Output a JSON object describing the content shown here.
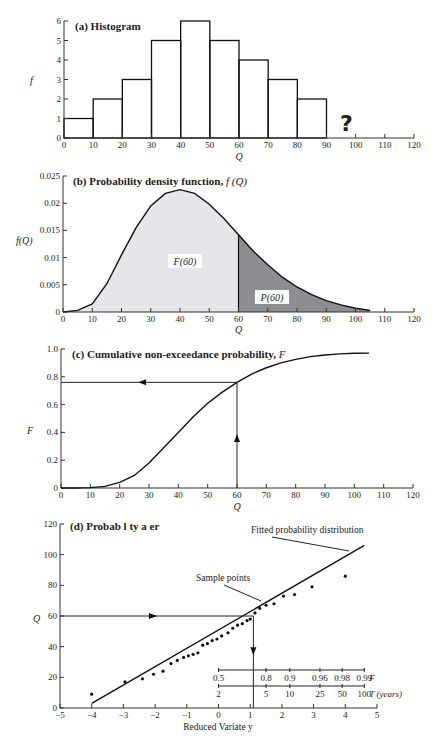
{
  "chart_data": [
    {
      "panel": "a",
      "type": "bar",
      "title": "(a) Histogram",
      "xlabel": "Q",
      "ylabel": "f",
      "bins": [
        [
          0,
          10
        ],
        [
          10,
          20
        ],
        [
          20,
          30
        ],
        [
          30,
          40
        ],
        [
          40,
          50
        ],
        [
          50,
          60
        ],
        [
          60,
          70
        ],
        [
          70,
          80
        ],
        [
          80,
          90
        ]
      ],
      "values": [
        1,
        2,
        3,
        5,
        6,
        5,
        4,
        3,
        2
      ],
      "xlim": [
        0,
        120
      ],
      "ylim": [
        0,
        6
      ],
      "xticks": [
        0,
        10,
        20,
        30,
        40,
        50,
        60,
        70,
        80,
        90,
        100,
        110,
        120
      ],
      "yticks": [
        0,
        1,
        2,
        3,
        4,
        5,
        6
      ],
      "annotation": "?",
      "annotation_x": 95
    },
    {
      "panel": "b",
      "type": "area",
      "title": "(b) Probability density function, f (Q)",
      "xlabel": "Q",
      "ylabel": "f(Q)",
      "xlim": [
        0,
        120
      ],
      "ylim": [
        0,
        0.025
      ],
      "xticks": [
        0,
        10,
        20,
        30,
        40,
        50,
        60,
        70,
        80,
        90,
        100,
        110,
        120
      ],
      "yticks": [
        0,
        0.005,
        0.01,
        0.015,
        0.02,
        0.025
      ],
      "curve": {
        "x": [
          0,
          5,
          10,
          15,
          20,
          25,
          30,
          35,
          40,
          45,
          50,
          55,
          60,
          65,
          70,
          75,
          80,
          85,
          90,
          95,
          100,
          105
        ],
        "y": [
          0,
          0.0003,
          0.0015,
          0.0052,
          0.0105,
          0.0155,
          0.0195,
          0.0218,
          0.0225,
          0.0218,
          0.0198,
          0.0172,
          0.0142,
          0.0112,
          0.0087,
          0.0064,
          0.0046,
          0.0032,
          0.0021,
          0.0013,
          0.0007,
          0.0003
        ]
      },
      "split_x": 60,
      "regions": [
        {
          "label": "F(60)",
          "range": [
            0,
            60
          ],
          "fill": "#e6e6ea"
        },
        {
          "label": "P(60)",
          "range": [
            60,
            105
          ],
          "fill": "#8e8e92"
        }
      ]
    },
    {
      "panel": "c",
      "type": "line",
      "title": "(c) Cumulative non-exceedance probability, F",
      "xlabel": "Q",
      "ylabel": "F",
      "xlim": [
        0,
        120
      ],
      "ylim": [
        0,
        1.0
      ],
      "xticks": [
        0,
        10,
        20,
        30,
        40,
        50,
        60,
        70,
        80,
        90,
        100,
        110,
        120
      ],
      "yticks": [
        0,
        0.2,
        0.4,
        0.6,
        0.8,
        1.0
      ],
      "curve": {
        "x": [
          0,
          5,
          10,
          15,
          20,
          25,
          30,
          35,
          40,
          45,
          50,
          55,
          60,
          65,
          70,
          75,
          80,
          85,
          90,
          95,
          100,
          105
        ],
        "y": [
          0,
          0,
          0.003,
          0.012,
          0.04,
          0.09,
          0.18,
          0.29,
          0.4,
          0.51,
          0.61,
          0.69,
          0.76,
          0.82,
          0.865,
          0.9,
          0.925,
          0.945,
          0.957,
          0.965,
          0.969,
          0.97
        ]
      },
      "guide": {
        "x": 60,
        "F": 0.76
      }
    },
    {
      "panel": "d",
      "type": "scatter",
      "title": "(d) Probab l ty  a  er",
      "xlabel": "Reduced Variate y",
      "ylabel": "Q",
      "xlim": [
        -5,
        5
      ],
      "ylim": [
        0,
        120
      ],
      "xticks": [
        -5,
        -4,
        -3,
        -2,
        -1,
        0,
        1,
        2,
        3,
        4,
        5
      ],
      "yticks": [
        0,
        20,
        40,
        60,
        80,
        100,
        120
      ],
      "points": {
        "y": [
          -4.0,
          -2.95,
          -2.4,
          -2.05,
          -1.75,
          -1.5,
          -1.3,
          -1.1,
          -0.95,
          -0.8,
          -0.65,
          -0.5,
          -0.35,
          -0.2,
          -0.05,
          0.1,
          0.3,
          0.45,
          0.6,
          0.75,
          0.9,
          1.0,
          1.15,
          1.3,
          1.5,
          1.75,
          2.05,
          2.4,
          2.95,
          4.0
        ],
        "Q": [
          9,
          17,
          19,
          22,
          24,
          29,
          31,
          33,
          34,
          35,
          36,
          41,
          42,
          44,
          45,
          47,
          49,
          52,
          54,
          55,
          57,
          58,
          62,
          65,
          67,
          68,
          73,
          74,
          79,
          86,
          88
        ]
      },
      "fit_line": {
        "y": [
          -4.0,
          4.6
        ],
        "Q": [
          3,
          106
        ]
      },
      "guide": {
        "Q": 60,
        "y": 1.1
      },
      "annotations": [
        {
          "text": "Fitted probability distribution"
        },
        {
          "text": "Sample points"
        }
      ],
      "inset_axes": {
        "F": {
          "label": "F",
          "ticks": [
            "0.5",
            "0.8",
            "0.9",
            "0.96",
            "0.98",
            "0.99"
          ],
          "y": [
            0.0,
            1.5,
            2.25,
            3.2,
            3.9,
            4.6
          ]
        },
        "T": {
          "label": "T (years)",
          "ticks": [
            "2",
            "5",
            "10",
            "25",
            "50",
            "100"
          ],
          "y": [
            0.0,
            1.5,
            2.25,
            3.2,
            3.9,
            4.6
          ]
        }
      }
    }
  ],
  "labels": {
    "a_title": "(a) Histogram",
    "b_title_bold": "(b) Probability density function, ",
    "b_title_ital": "f (Q)",
    "c_title_bold": "(c) Cumulative non-exceedance probability, ",
    "c_title_ital": "F",
    "d_title": "(d) Probab l ty  a  er",
    "question": "?",
    "f": "f",
    "fQ": "f(Q)",
    "F": "F",
    "Q": "Q",
    "F60": "F(60)",
    "P60": "P(60)",
    "fitted": "Fitted probability distribution",
    "sample": "Sample points",
    "reduced": "Reduced Variate y",
    "F_axis": "F",
    "T_axis": "T (years)"
  }
}
